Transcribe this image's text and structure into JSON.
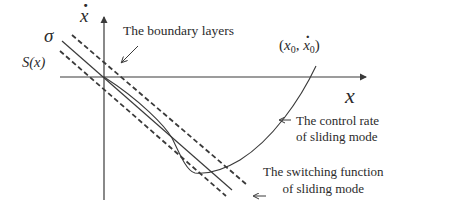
{
  "diagram": {
    "type": "phase-plane sliding mode diagram",
    "axes": {
      "x_label": "x",
      "y_label": "ẋ",
      "y_label_base": "x"
    },
    "surface_labels": {
      "sigma": "σ",
      "switching_surface": "S(x)"
    },
    "initial_point": {
      "open": "(",
      "x_base": "x",
      "x_sub": "0",
      "comma": ",",
      "xdot_base": "x",
      "xdot_sub": "0",
      "close": ")"
    },
    "annotations": {
      "boundary_layers": "The boundary layers",
      "control_rate_line1": "The control rate",
      "control_rate_line2": "of sliding mode",
      "switching_function_line1": "The switching function",
      "switching_function_line2": "of sliding mode"
    },
    "colors": {
      "lines": "#3a3a3a",
      "text": "#2b2b2b",
      "background": "#ffffff"
    }
  }
}
